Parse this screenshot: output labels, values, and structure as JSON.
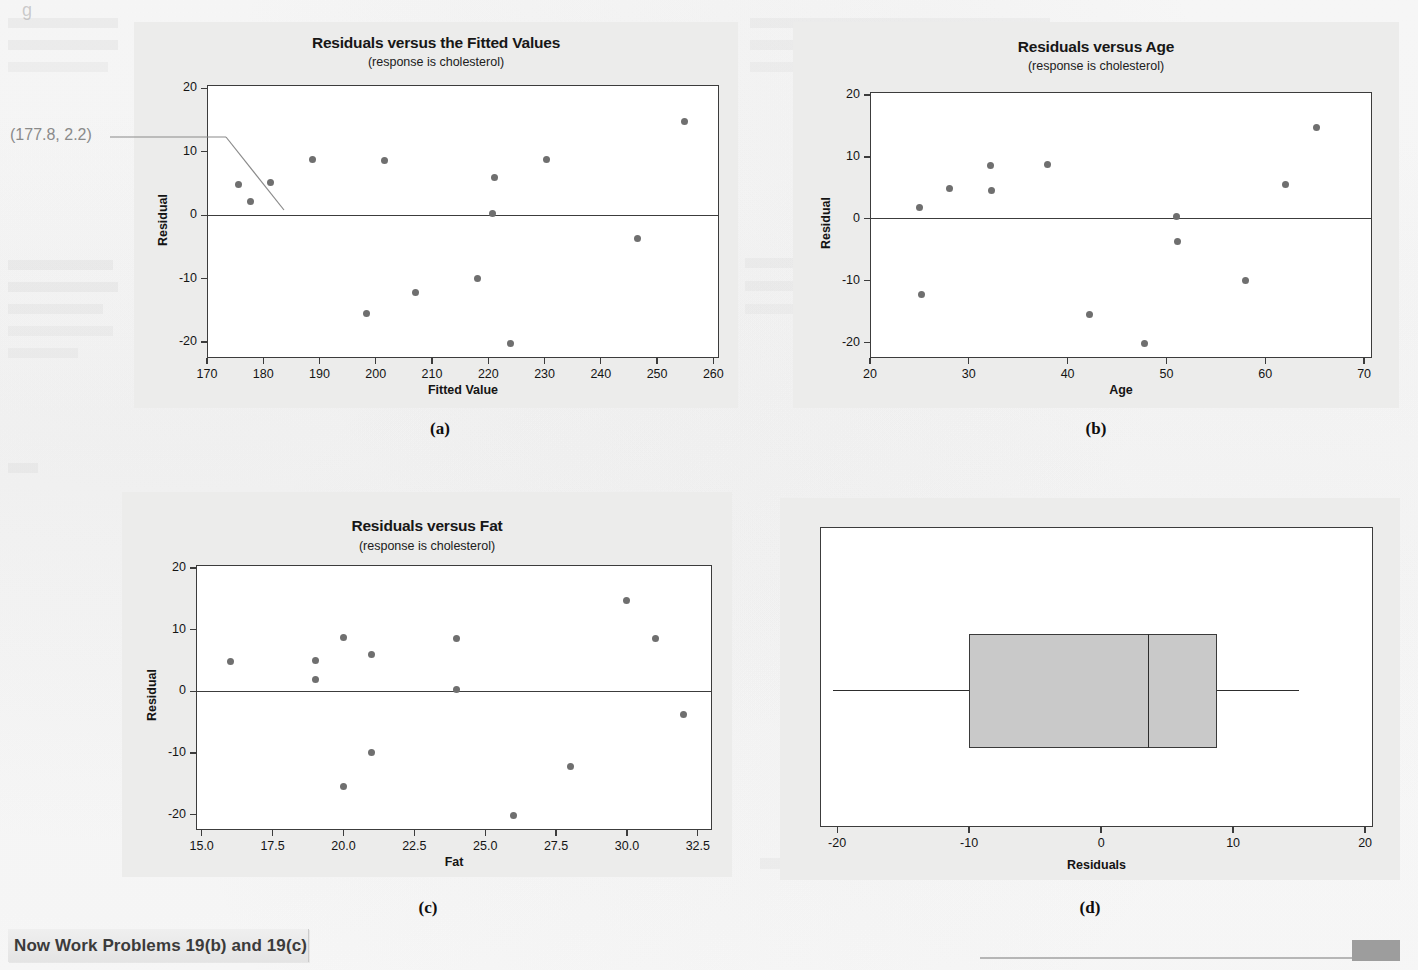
{
  "figure": {
    "caption_a": "(a)",
    "caption_b": "(b)",
    "caption_c": "(c)",
    "caption_d": "(d)",
    "footer_note": "Now Work Problems 19(b) and 19(c)",
    "top_ghost": "g"
  },
  "annotation": {
    "label": "(177.8, 2.2)",
    "points_to_x": 177.8,
    "points_to_y": 2.2
  },
  "chart_data": [
    {
      "id": "panel-a",
      "type": "scatter",
      "title": "Residuals versus the Fitted Values",
      "subtitle": "(response is cholesterol)",
      "xlabel": "Fitted Value",
      "ylabel": "Residual",
      "xlim": [
        170,
        261
      ],
      "ylim": [
        -22.5,
        20.5
      ],
      "xticks": [
        170,
        180,
        190,
        200,
        210,
        220,
        230,
        240,
        250,
        260
      ],
      "xtick_labels": [
        "170",
        "180",
        "190",
        "200",
        "210",
        "220",
        "230",
        "240",
        "250",
        "260"
      ],
      "yticks": [
        20,
        10,
        0,
        -10,
        -20
      ],
      "ytick_labels": [
        "20",
        "10",
        "0",
        "-10",
        "-20"
      ],
      "grid": false,
      "reference_line_y": 0,
      "x": [
        175.6,
        177.8,
        181.2,
        188.8,
        201.5,
        198.4,
        207.0,
        218.0,
        220.8,
        221.1,
        223.9,
        230.3,
        246.6,
        254.8
      ],
      "y": [
        4.9,
        2.2,
        5.2,
        8.7,
        8.6,
        -15.5,
        -12.2,
        -9.9,
        0.3,
        5.9,
        -20.2,
        8.8,
        -3.7,
        14.7
      ]
    },
    {
      "id": "panel-b",
      "type": "scatter",
      "title": "Residuals versus Age",
      "subtitle": "(response is cholesterol)",
      "xlabel": "Age",
      "ylabel": "Residual",
      "xlim": [
        20,
        70.8
      ],
      "ylim": [
        -22.5,
        20.5
      ],
      "xticks": [
        20,
        30,
        40,
        50,
        60,
        70
      ],
      "xtick_labels": [
        "20",
        "30",
        "40",
        "50",
        "60",
        "70"
      ],
      "yticks": [
        20,
        10,
        0,
        -10,
        -20
      ],
      "ytick_labels": [
        "20",
        "10",
        "0",
        "-10",
        "-20"
      ],
      "grid": false,
      "reference_line_y": 0,
      "x": [
        25.0,
        25.2,
        28.0,
        32.2,
        32.3,
        38.0,
        42.2,
        47.8,
        51.0,
        51.1,
        58.0,
        62.0,
        65.2
      ],
      "y": [
        1.9,
        -12.2,
        4.9,
        8.6,
        4.5,
        8.8,
        -15.5,
        -20.2,
        0.3,
        -3.7,
        -9.9,
        5.6,
        14.7
      ]
    },
    {
      "id": "panel-c",
      "type": "scatter",
      "title": "Residuals versus Fat",
      "subtitle": "(response is cholesterol)",
      "xlabel": "Fat",
      "ylabel": "Residual",
      "xlim": [
        14.8,
        33.0
      ],
      "ylim": [
        -22.5,
        20.5
      ],
      "xticks": [
        15.0,
        17.5,
        20.0,
        22.5,
        25.0,
        27.5,
        30.0,
        32.5
      ],
      "xtick_labels": [
        "15.0",
        "17.5",
        "20.0",
        "22.5",
        "25.0",
        "27.5",
        "30.0",
        "32.5"
      ],
      "yticks": [
        20,
        10,
        0,
        -10,
        -20
      ],
      "ytick_labels": [
        "20",
        "10",
        "0",
        "-10",
        "-20"
      ],
      "grid": false,
      "reference_line_y": 0,
      "x": [
        16.0,
        19.0,
        19.0,
        20.0,
        20.0,
        21.0,
        21.0,
        24.0,
        24.0,
        26.0,
        28.0,
        30.0,
        31.0,
        32.0
      ],
      "y": [
        4.9,
        5.0,
        1.9,
        8.7,
        -15.5,
        5.9,
        -9.9,
        8.6,
        0.3,
        -20.2,
        -12.2,
        14.7,
        8.6,
        -3.7
      ]
    },
    {
      "id": "panel-d",
      "type": "boxplot",
      "title": "",
      "subtitle": "",
      "xlabel": "Residuals",
      "ylabel": "",
      "xlim": [
        -21.3,
        20.6
      ],
      "xticks": [
        -20,
        -10,
        0,
        10,
        20
      ],
      "xtick_labels": [
        "-20",
        "-10",
        "0",
        "10",
        "20"
      ],
      "grid": false,
      "orientation": "horizontal",
      "box": {
        "min_whisker": -20.3,
        "q1": -10.0,
        "median": 3.6,
        "q3": 8.8,
        "max_whisker": 15.0
      }
    }
  ],
  "colors": {
    "panel_background": "#ececeb",
    "plot_background": "#ffffff",
    "frame": "#3c3c3c",
    "marker": "#6f6f6f",
    "box_fill": "#c9c9c9",
    "box_border": "#3a3a3a",
    "annotation_text": "#8a8a8a",
    "footer_block": "#9d9d9d"
  }
}
